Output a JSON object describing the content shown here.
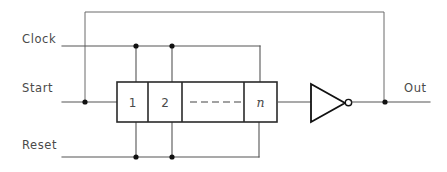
{
  "diagram": {
    "type": "schematic",
    "canvas": {
      "width": 447,
      "height": 172
    },
    "colors": {
      "background": "#ffffff",
      "wire": "#555555",
      "outline": "#2a2a2a",
      "gate": "#111111",
      "text": "#4a4a4a"
    },
    "inputs": [
      {
        "id": "clock",
        "label": "Clock",
        "label_x": 22,
        "label_y": 43,
        "wire_y": 46
      },
      {
        "id": "start",
        "label": "Start",
        "label_x": 22,
        "label_y": 92,
        "wire_y": 102
      },
      {
        "id": "reset",
        "label": "Reset",
        "label_x": 22,
        "label_y": 149,
        "wire_y": 157
      }
    ],
    "outputs": [
      {
        "id": "out",
        "label": "Out",
        "label_x": 404,
        "label_y": 92,
        "wire_y": 102
      }
    ],
    "register": {
      "name": "shift-register",
      "x": 117,
      "y": 82,
      "width": 160,
      "height": 40,
      "cells": [
        {
          "id": "cell-1",
          "label": "1",
          "style": "upright",
          "x": 117,
          "width": 31
        },
        {
          "id": "cell-2",
          "label": "2",
          "style": "upright",
          "x": 148,
          "width": 34
        },
        {
          "id": "cell-ellipsis",
          "label": "- - - - -",
          "style": "dashes",
          "x": 182,
          "width": 62,
          "dash_count": 5
        },
        {
          "id": "cell-n",
          "label": "n",
          "style": "italic",
          "x": 244,
          "width": 33
        }
      ]
    },
    "gate": {
      "id": "inverter",
      "type": "NOT",
      "label": "inverter",
      "apex_x": 345,
      "left_x": 311,
      "top_y": 84,
      "bottom_y": 122,
      "bubble_cx": 348.5,
      "bubble_r": 3.2
    },
    "junctions": [
      {
        "id": "start-tap",
        "x": 85,
        "y": 102
      },
      {
        "id": "clock-tap-1",
        "x": 136,
        "y": 46
      },
      {
        "id": "clock-tap-2",
        "x": 172,
        "y": 46
      },
      {
        "id": "reset-tap-1",
        "x": 136,
        "y": 157
      },
      {
        "id": "reset-tap-2",
        "x": 172,
        "y": 157
      },
      {
        "id": "output-tap",
        "x": 385,
        "y": 102
      }
    ],
    "feedback": {
      "id": "feedback-loop",
      "description": "Output fed back to Start input",
      "top_y": 12,
      "left_x": 85,
      "right_x": 384
    }
  }
}
